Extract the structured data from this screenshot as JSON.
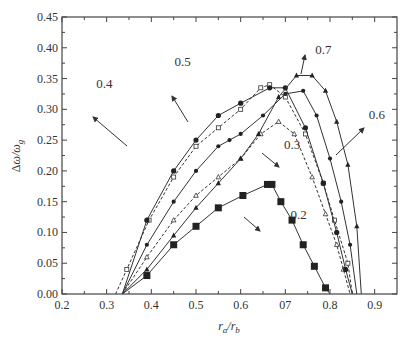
{
  "chart_data": {
    "type": "line",
    "title": "",
    "xlabel": "r_a/r_b",
    "ylabel": "Δω/ω_g",
    "xlim": [
      0.2,
      0.95
    ],
    "ylim": [
      0.0,
      0.45
    ],
    "grid": false,
    "legend": "none (inline labels with arrows)",
    "x_ticks": [
      "0.2",
      "0.3",
      "0.4",
      "0.5",
      "0.6",
      "07",
      "0.8",
      "0.9"
    ],
    "y_ticks": [
      "0.00",
      "0.05",
      "0.10",
      "0.15",
      "0.20",
      "0.25",
      "0.30",
      "0.35",
      "0.40",
      "0.45"
    ],
    "series": [
      {
        "name": "0.2",
        "marker": "filled-square-large",
        "line": "solid",
        "x": [
          0.335,
          0.39,
          0.45,
          0.5,
          0.55,
          0.605,
          0.66,
          0.67,
          0.69,
          0.715,
          0.74,
          0.765,
          0.79,
          0.8
        ],
        "y": [
          0.0,
          0.03,
          0.08,
          0.11,
          0.14,
          0.16,
          0.178,
          0.178,
          0.15,
          0.12,
          0.08,
          0.045,
          0.01,
          0.0
        ]
      },
      {
        "name": "0.3",
        "marker": "open-triangle",
        "line": "dashed",
        "x": [
          0.335,
          0.39,
          0.45,
          0.5,
          0.55,
          0.6,
          0.645,
          0.685,
          0.72,
          0.76,
          0.79,
          0.815,
          0.83,
          0.845
        ],
        "y": [
          0.0,
          0.06,
          0.12,
          0.16,
          0.19,
          0.22,
          0.26,
          0.28,
          0.26,
          0.19,
          0.13,
          0.08,
          0.04,
          0.0
        ]
      },
      {
        "name": "0.4",
        "marker": "open-square",
        "line": "dashed",
        "x": [
          0.32,
          0.345,
          0.395,
          0.45,
          0.5,
          0.55,
          0.6,
          0.645,
          0.665,
          0.7,
          0.745,
          0.785,
          0.81,
          0.84,
          0.85
        ],
        "y": [
          0.0,
          0.04,
          0.12,
          0.19,
          0.24,
          0.27,
          0.3,
          0.335,
          0.34,
          0.32,
          0.26,
          0.18,
          0.12,
          0.05,
          0.0
        ]
      },
      {
        "name": "0.5",
        "marker": "filled-circle",
        "line": "solid",
        "x": [
          0.335,
          0.39,
          0.45,
          0.5,
          0.55,
          0.6,
          0.665,
          0.7,
          0.745,
          0.785,
          0.815,
          0.835,
          0.85
        ],
        "y": [
          0.0,
          0.12,
          0.2,
          0.25,
          0.29,
          0.31,
          0.335,
          0.335,
          0.27,
          0.18,
          0.1,
          0.04,
          0.0
        ]
      },
      {
        "name": "0.6",
        "marker": "filled-circle-small",
        "line": "solid",
        "x": [
          0.335,
          0.39,
          0.45,
          0.5,
          0.55,
          0.575,
          0.6,
          0.65,
          0.7,
          0.74,
          0.77,
          0.8,
          0.825,
          0.845,
          0.86
        ],
        "y": [
          0.0,
          0.08,
          0.15,
          0.2,
          0.24,
          0.25,
          0.26,
          0.29,
          0.325,
          0.33,
          0.29,
          0.22,
          0.15,
          0.08,
          0.0
        ]
      },
      {
        "name": "0.7",
        "marker": "filled-triangle",
        "line": "solid",
        "x": [
          0.335,
          0.39,
          0.45,
          0.5,
          0.55,
          0.6,
          0.64,
          0.685,
          0.725,
          0.76,
          0.79,
          0.815,
          0.84,
          0.86,
          0.87
        ],
        "y": [
          0.0,
          0.04,
          0.095,
          0.14,
          0.18,
          0.22,
          0.26,
          0.32,
          0.355,
          0.355,
          0.33,
          0.28,
          0.21,
          0.11,
          0.0
        ]
      }
    ],
    "annotations": [
      {
        "text": "0.2",
        "x": 0.73,
        "y": 0.122
      },
      {
        "text": "0.3",
        "x": 0.715,
        "y": 0.235
      },
      {
        "text": "0.4",
        "x": 0.295,
        "y": 0.335
      },
      {
        "text": "0.5",
        "x": 0.47,
        "y": 0.37
      },
      {
        "text": "0.6",
        "x": 0.905,
        "y": 0.285
      },
      {
        "text": "0.7",
        "x": 0.785,
        "y": 0.39
      }
    ]
  }
}
